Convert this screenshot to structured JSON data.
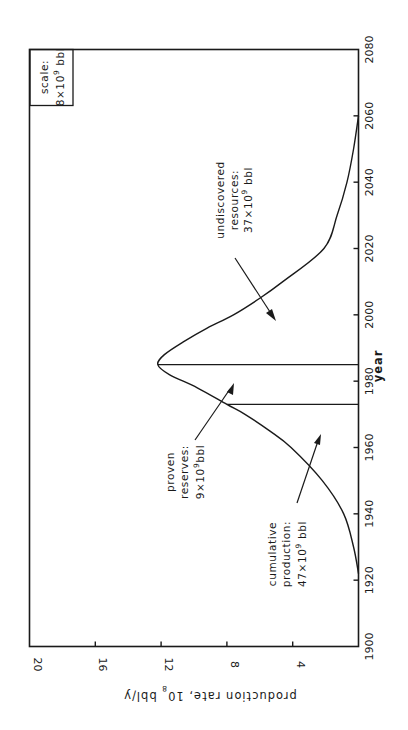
{
  "chart_data": {
    "type": "line",
    "orientation": "rotated-90-ccw",
    "title": "",
    "xlabel": "year",
    "ylabel": "production rate, 10^8 bbl/y",
    "ylabel_parts": {
      "pre": "production rate, 10",
      "sup": "8",
      "post": " bbl/y"
    },
    "xlim": [
      1900,
      2080
    ],
    "ylim": [
      0,
      20
    ],
    "xticks": [
      1900,
      1920,
      1940,
      1960,
      1980,
      2000,
      2020,
      2040,
      2060,
      2080
    ],
    "yticks": [
      4,
      8,
      12,
      16,
      20
    ],
    "ytick_labels_shown": [
      "4",
      "8",
      "12",
      "16",
      "20"
    ],
    "grid": false,
    "series": [
      {
        "name": "production rate",
        "x": [
          1922,
          1930,
          1940,
          1950,
          1960,
          1965,
          1970,
          1973,
          1978,
          1982,
          1985,
          1988,
          1992,
          1996,
          2000,
          2005,
          2010,
          2020,
          2030,
          2040,
          2050,
          2060
        ],
        "values": [
          0,
          0.3,
          0.9,
          2.2,
          4.1,
          5.4,
          6.9,
          8.0,
          9.8,
          11.5,
          12.2,
          11.8,
          10.6,
          9.2,
          7.6,
          6.0,
          4.6,
          2.1,
          1.3,
          0.7,
          0.3,
          0
        ]
      }
    ],
    "vertical_markers": [
      {
        "x": 1973,
        "y_top": 8.0,
        "meaning": "boundary cumulative production / proven reserves"
      },
      {
        "x": 1985,
        "y_top": 12.2,
        "meaning": "boundary proven reserves / undiscovered resources (peak)"
      }
    ],
    "annotations": [
      {
        "id": "undiscovered",
        "lines": [
          "undiscovered",
          "resources:",
          "37×10⁹ bbl"
        ],
        "value": "37×10^9 bbl"
      },
      {
        "id": "proven",
        "lines": [
          "proven",
          "reserves:",
          "9×10⁹ bbl"
        ],
        "value": "9×10^9 bbl"
      },
      {
        "id": "cumulative",
        "lines": [
          "cumulative",
          "production:",
          "47×10⁹ bbl"
        ],
        "value": "47×10^9 bbl"
      }
    ],
    "legend": {
      "title": "scale:",
      "value": "8×10⁹ bbl",
      "position": "top-right (upper-left in rotated view)"
    }
  },
  "labels": {
    "xlabel": "year",
    "ylabel_pre": "production rate, 10",
    "ylabel_sup": "8",
    "ylabel_post": " bbl/y",
    "scale_title": "scale:",
    "scale_pre": "8×10",
    "scale_sup": "9",
    "scale_post": " bbl",
    "undiscovered_l1": "undiscovered",
    "undiscovered_l2": "resources:",
    "undiscovered_pre": "37×10",
    "undiscovered_sup": "9",
    "undiscovered_post": " bbl",
    "proven_l1": "proven",
    "proven_l2": "reserves:",
    "proven_pre": "9×10",
    "proven_sup": "9",
    "proven_post": "bbl",
    "cumulative_l1": "cumulative",
    "cumulative_l2": "production:",
    "cumulative_pre": "47×10",
    "cumulative_sup": "9",
    "cumulative_post": " bbl"
  }
}
